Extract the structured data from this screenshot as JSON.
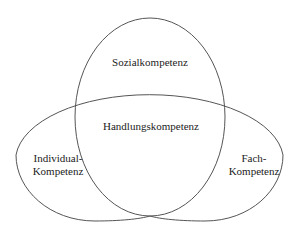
{
  "diagram": {
    "type": "venn",
    "sets": [
      {
        "id": "social",
        "label": "Sozialkompetenz"
      },
      {
        "id": "individual",
        "label_line1": "Individual-",
        "label_line2": "Kompetenz"
      },
      {
        "id": "professional",
        "label_line1": "Fach-",
        "label_line2": "Kompetenz"
      }
    ],
    "intersection": {
      "label": "Handlungskompetenz"
    },
    "colors": {
      "stroke": "#555555",
      "text": "#222222",
      "background": "#ffffff"
    }
  }
}
